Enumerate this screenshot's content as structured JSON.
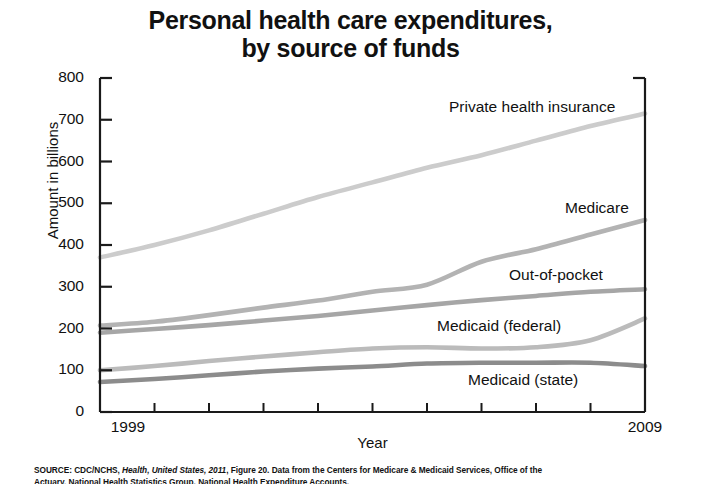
{
  "title": {
    "line1": "Personal health care expenditures,",
    "line2": "by source of funds"
  },
  "axes": {
    "y_label": "Amount in billions",
    "x_label": "Year",
    "y_ticks": [
      "0",
      "100",
      "200",
      "300",
      "400",
      "500",
      "600",
      "700",
      "800"
    ],
    "x_tick_start": "1999",
    "x_tick_end": "2009"
  },
  "series_labels": {
    "private": "Private health insurance",
    "medicare": "Medicare",
    "oop": "Out-of-pocket",
    "medicaid_federal": "Medicaid (federal)",
    "medicaid_state": "Medicaid (state)"
  },
  "source": {
    "prefix": "SOURCE: CDC/NCHS, ",
    "italic": "Health, United States, 2011",
    "suffix": ", Figure 20. Data from the Centers for Medicare & Medicaid Services, Office of the",
    "line2": "Actuary, National Health Statistics Group. National Health Expenditure Accounts."
  },
  "chart_data": {
    "type": "line",
    "title": "Personal health care expenditures, by source of funds",
    "xlabel": "Year",
    "ylabel": "Amount in billions",
    "xlim": [
      1999,
      2009
    ],
    "ylim": [
      0,
      800
    ],
    "grid": false,
    "legend": "inline-right-labels",
    "x": [
      1999,
      2000,
      2001,
      2002,
      2003,
      2004,
      2005,
      2006,
      2007,
      2008,
      2009
    ],
    "series": [
      {
        "name": "Private health insurance",
        "color": "#cccccc",
        "values": [
          370,
          400,
          435,
          475,
          515,
          550,
          585,
          615,
          650,
          685,
          715
        ]
      },
      {
        "name": "Medicare",
        "color": "#b3b3b3",
        "values": [
          207,
          216,
          232,
          250,
          267,
          288,
          305,
          360,
          390,
          425,
          460
        ]
      },
      {
        "name": "Out-of-pocket",
        "color": "#a6a6a6",
        "values": [
          190,
          199,
          208,
          219,
          230,
          243,
          256,
          268,
          278,
          288,
          294
        ]
      },
      {
        "name": "Medicaid (federal)",
        "color": "#bbbbbb",
        "values": [
          100,
          110,
          122,
          133,
          143,
          152,
          155,
          152,
          155,
          172,
          224
        ]
      },
      {
        "name": "Medicaid (state)",
        "color": "#8c8c8c",
        "values": [
          72,
          79,
          88,
          97,
          104,
          109,
          116,
          118,
          118,
          118,
          110
        ]
      }
    ]
  }
}
